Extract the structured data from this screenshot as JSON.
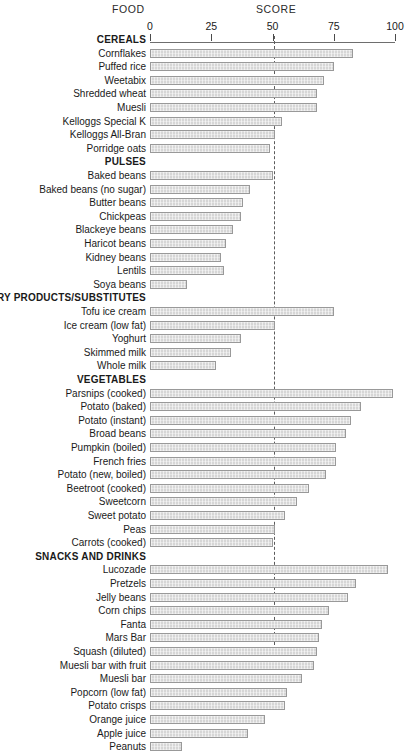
{
  "header": {
    "food_label": "FOOD",
    "score_label": "SCORE"
  },
  "axis": {
    "ticks": [
      "0",
      "25",
      "50",
      "75",
      "100"
    ],
    "reference_line_value": 50
  },
  "chart_data": {
    "type": "bar",
    "orientation": "horizontal",
    "title": "",
    "xlabel": "SCORE",
    "ylabel": "FOOD",
    "xlim": [
      0,
      100
    ],
    "xticks": [
      0,
      25,
      50,
      75,
      100
    ],
    "grid": false,
    "legend": "none",
    "annotations": [
      {
        "type": "reference-line",
        "value": 50,
        "style": "dashed"
      }
    ],
    "groups": [
      {
        "name": "CEREALS",
        "categories": [
          "Cornflakes",
          "Puffed rice",
          "Weetabix",
          "Shredded wheat",
          "Muesli",
          "Kelloggs Special K",
          "Kelloggs All-Bran",
          "Porridge oats"
        ],
        "values": [
          83,
          75,
          71,
          68,
          68,
          54,
          51,
          49
        ]
      },
      {
        "name": "PULSES",
        "categories": [
          "Baked beans",
          "Baked beans (no sugar)",
          "Butter beans",
          "Chickpeas",
          "Blackeye beans",
          "Haricot beans",
          "Kidney beans",
          "Lentils",
          "Soya beans"
        ],
        "values": [
          50,
          41,
          38,
          37,
          34,
          31,
          29,
          30,
          15
        ]
      },
      {
        "name": "DAIRY PRODUCTS/SUBSTITUTES",
        "categories": [
          "Tofu ice cream",
          "Ice cream (low fat)",
          "Yoghurt",
          "Skimmed milk",
          "Whole milk"
        ],
        "values": [
          75,
          51,
          37,
          33,
          27
        ]
      },
      {
        "name": "VEGETABLES",
        "categories": [
          "Parsnips (cooked)",
          "Potato (baked)",
          "Potato (instant)",
          "Broad beans",
          "Pumpkin (boiled)",
          "French fries",
          "Potato (new, boiled)",
          "Beetroot (cooked)",
          "Sweetcorn",
          "Sweet potato",
          "Peas",
          "Carrots (cooked)"
        ],
        "values": [
          99,
          86,
          82,
          80,
          76,
          76,
          72,
          65,
          60,
          55,
          51,
          50
        ]
      },
      {
        "name": "SNACKS AND DRINKS",
        "categories": [
          "Lucozade",
          "Pretzels",
          "Jelly beans",
          "Corn chips",
          "Fanta",
          "Mars Bar",
          "Squash (diluted)",
          "Muesli bar with fruit",
          "Muesli bar",
          "Popcorn (low fat)",
          "Potato crisps",
          "Orange juice",
          "Apple juice",
          "Peanuts"
        ],
        "values": [
          97,
          84,
          81,
          73,
          70,
          69,
          68,
          67,
          62,
          56,
          55,
          47,
          40,
          13
        ]
      }
    ]
  },
  "style": {
    "bar_fill": "#d6d6d6",
    "bar_border": "#999999",
    "axis_color": "#6e6e6e",
    "text_color": "#1a1a1a"
  }
}
